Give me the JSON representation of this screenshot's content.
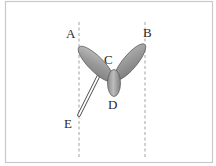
{
  "diagram": {
    "type": "mechanical-illustration",
    "labels": {
      "A": "A",
      "B": "B",
      "C": "C",
      "D": "D",
      "E": "E"
    },
    "colors": {
      "frame": "#c8c8c8",
      "dashed_line": "#8a8a8a",
      "lobe_fill": "#9a9a9a",
      "lobe_highlight": "#c4c4c4",
      "lobe_stroke": "#555555",
      "rod_fill": "#ffffff",
      "rod_stroke": "#444444",
      "label_text": "#2a2a2a"
    }
  }
}
